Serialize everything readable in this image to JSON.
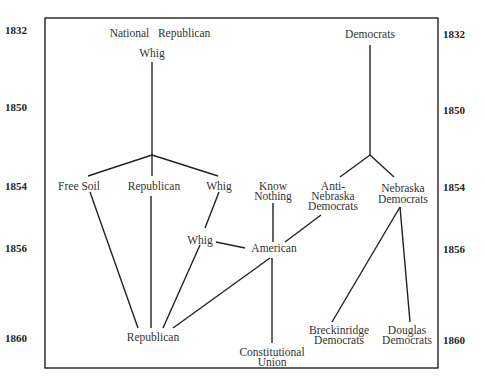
{
  "diagram": {
    "years_left": [
      "1832",
      "1850",
      "1854",
      "1856",
      "1860"
    ],
    "years_right": [
      "1832",
      "1850",
      "1854",
      "1856",
      "1860"
    ],
    "nodes": {
      "national_republican": "National   Republican",
      "whig_1832": "Whig",
      "democrats_1832": "Democrats",
      "free_soil": "Free Soil",
      "republican_1854": "Republican",
      "whig_1854": "Whig",
      "know_nothing_1": "Know",
      "know_nothing_2": "Nothing",
      "anti_nebraska_1": "Anti-",
      "anti_nebraska_2": "Nebraska",
      "anti_nebraska_3": "Democrats",
      "nebraska_dem_1": "Nebraska",
      "nebraska_dem_2": "Democrats",
      "whig_1856": "Whig",
      "american_1856": "American",
      "republican_1860": "Republican",
      "constitutional_union_1": "Constitutional",
      "constitutional_union_2": "Union",
      "breckinridge_1": "Breckinridge",
      "breckinridge_2": "Democrats",
      "douglas_1": "Douglas",
      "douglas_2": "Democrats"
    },
    "line_color": "#222222"
  }
}
